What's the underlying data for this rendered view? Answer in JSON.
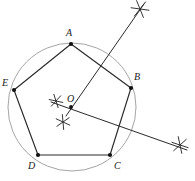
{
  "figure": {
    "type": "geometry-construction",
    "canvas": {
      "width": 195,
      "height": 181
    },
    "colors": {
      "background": "#ffffff",
      "circle_stroke": "#9a9a9a",
      "polygon_stroke": "#2a2a2a",
      "ray_stroke": "#2a2a2a",
      "mark_stroke": "#2a2a2a",
      "point_fill": "#111111",
      "label_color": "#1a1a1a"
    },
    "circle": {
      "label": "circumscribed circle",
      "center": {
        "x": 72,
        "y": 107
      },
      "radius": 64,
      "stroke_width": 0.9
    },
    "center_point": {
      "label": "O",
      "x": 71,
      "y": 107,
      "label_x": 67,
      "label_y": 94
    },
    "vertices": [
      {
        "label": "A",
        "x": 71,
        "y": 44,
        "label_x": 66,
        "label_y": 28
      },
      {
        "label": "B",
        "x": 131,
        "y": 88,
        "label_x": 134,
        "label_y": 72
      },
      {
        "label": "C",
        "x": 110,
        "y": 155,
        "label_x": 114,
        "label_y": 161
      },
      {
        "label": "D",
        "x": 38,
        "y": 155,
        "label_x": 28,
        "label_y": 161
      },
      {
        "label": "E",
        "x": 14,
        "y": 90,
        "label_x": 2,
        "label_y": 78
      }
    ],
    "polygon_edges": [
      {
        "name": "edge-A-B",
        "from": "A",
        "to": "B"
      },
      {
        "name": "edge-B-C",
        "from": "B",
        "to": "C"
      },
      {
        "name": "edge-C-D",
        "from": "C",
        "to": "D"
      },
      {
        "name": "edge-D-E",
        "from": "D",
        "to": "E"
      },
      {
        "name": "edge-E-A",
        "from": "E",
        "to": "A"
      }
    ],
    "construction_rays": [
      {
        "name": "ray-O-to-upper-right-mark",
        "x1": 66,
        "y1": 116,
        "x2": 144,
        "y2": 4,
        "stroke_width": 1.0
      },
      {
        "name": "ray-through-O-to-lower-right-mark",
        "x1": 51,
        "y1": 102,
        "x2": 187,
        "y2": 150,
        "stroke_width": 1.0
      }
    ],
    "construction_marks": [
      {
        "name": "asterisk-mark-left-of-O",
        "x": 56,
        "y": 101,
        "radius": 7,
        "rotation": 12
      },
      {
        "name": "asterisk-mark-below-O",
        "x": 63,
        "y": 122,
        "radius": 7.5,
        "rotation": 25
      },
      {
        "name": "asterisk-mark-upper-right",
        "x": 140,
        "y": 9,
        "radius": 9,
        "rotation": 8
      },
      {
        "name": "asterisk-mark-lower-right",
        "x": 180,
        "y": 145,
        "radius": 8.5,
        "rotation": 18
      }
    ],
    "point_radius": 2.1
  }
}
